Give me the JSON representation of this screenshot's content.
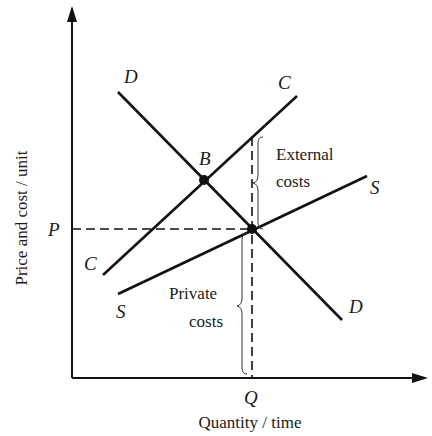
{
  "diagram": {
    "type": "economics-supply-demand-externality",
    "y_axis_title": "Price and cost / unit",
    "x_axis_title": "Quantity / time",
    "y_tick_label": "P",
    "x_tick_label": "Q",
    "curves": {
      "demand": {
        "label_start": "D",
        "label_end": "D"
      },
      "social_cost": {
        "label_start": "C",
        "label_end": "C"
      },
      "supply": {
        "label_start": "S",
        "label_end": "S"
      }
    },
    "points": {
      "social_optimum": "B",
      "market_equilibrium": ""
    },
    "annotations": {
      "external_line1": "External",
      "external_line2": "costs",
      "private_line1": "Private",
      "private_line2": "costs"
    },
    "colors": {
      "line": "#111111",
      "background": "#ffffff"
    }
  }
}
